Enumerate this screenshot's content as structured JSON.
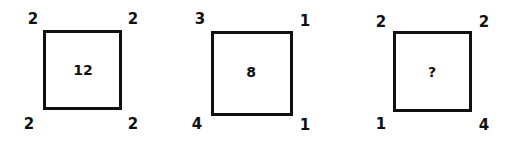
{
  "puzzle": {
    "panels": [
      {
        "center": "12",
        "top_left": "2",
        "top_right": "2",
        "bottom_left": "2",
        "bottom_right": "2"
      },
      {
        "center": "8",
        "top_left": "3",
        "top_right": "1",
        "bottom_left": "4",
        "bottom_right": "1"
      },
      {
        "center": "?",
        "top_left": "2",
        "top_right": "2",
        "bottom_left": "1",
        "bottom_right": "4"
      }
    ]
  }
}
